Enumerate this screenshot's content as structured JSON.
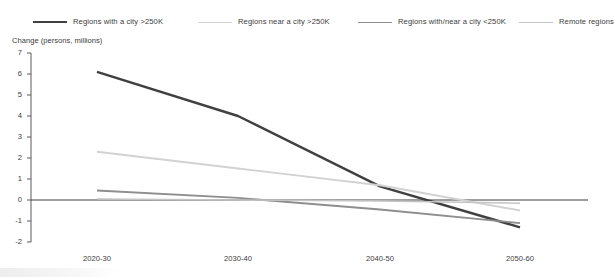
{
  "chart_data": {
    "type": "line",
    "title": "",
    "subtitle": "",
    "xlabel": "",
    "ylabel": "Change (persons, millions)",
    "categories": [
      "2020-30",
      "2030-40",
      "2040-50",
      "2050-60"
    ],
    "ylim": [
      -2,
      7
    ],
    "yticks": [
      7,
      6,
      5,
      4,
      3,
      2,
      1,
      0,
      -1,
      -2
    ],
    "ytick_labels": [
      "7",
      "6",
      "5",
      "4",
      "3",
      "2",
      "1",
      "0",
      "-1",
      "-2"
    ],
    "grid": false,
    "legend_position": "top",
    "zero_line": 0,
    "series": [
      {
        "name": "Regions with a city >250K",
        "color": "#404040",
        "width": 2.4,
        "values": [
          6.1,
          4.0,
          0.65,
          -1.3
        ]
      },
      {
        "name": "Regions near a city >250K",
        "color": "#d2d2d2",
        "width": 1.9,
        "values": [
          2.3,
          1.5,
          0.7,
          -0.5
        ]
      },
      {
        "name": "Regions with/near a city <250K",
        "color": "#8e8e8e",
        "width": 1.9,
        "values": [
          0.45,
          0.1,
          -0.45,
          -1.1
        ]
      },
      {
        "name": "Remote regions",
        "color": "#c4c4c4",
        "width": 1.5,
        "values": [
          0.05,
          0.0,
          -0.05,
          -0.15
        ]
      }
    ]
  },
  "legend": {
    "items": [
      {
        "label": "Regions with a city >250K",
        "color": "#404040"
      },
      {
        "label": "Regions near a city >250K",
        "color": "#d2d2d2"
      },
      {
        "label": "Regions with/near a city <250K",
        "color": "#8e8e8e"
      },
      {
        "label": "Remote regions",
        "color": "#c4c4c4"
      }
    ]
  },
  "axes": {
    "y_title": "Change (persons, millions)"
  }
}
